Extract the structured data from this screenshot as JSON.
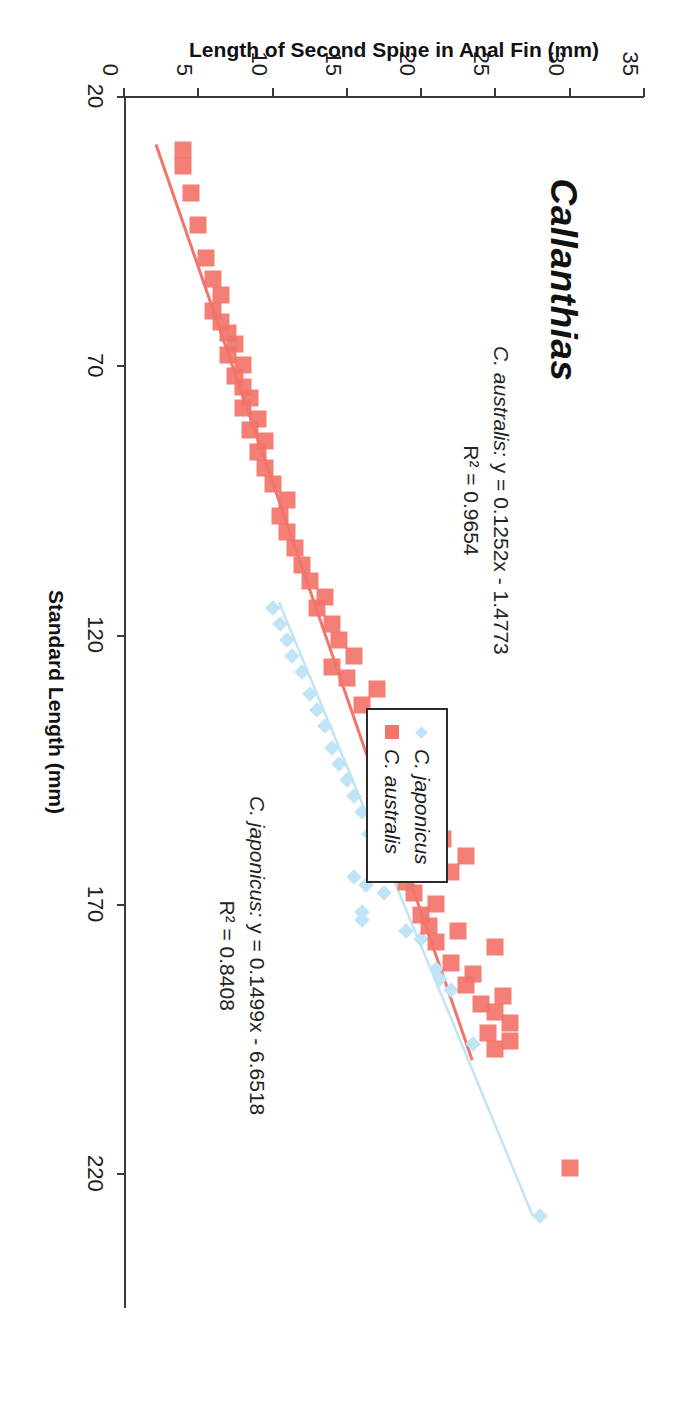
{
  "chart_data": {
    "type": "scatter",
    "title": "Callanthias",
    "xlabel": "Standard Length (mm)",
    "ylabel": "Length of Second Spine in Anal Fin (mm)",
    "xlim": [
      20,
      245
    ],
    "ylim": [
      0,
      35
    ],
    "xticks": [
      20,
      70,
      120,
      170,
      220
    ],
    "yticks": [
      0,
      5,
      10,
      15,
      20,
      25,
      30,
      35
    ],
    "grid": false,
    "legend_position": "center",
    "series": [
      {
        "name": "C. japonicus",
        "marker": "diamond",
        "color": "#bfe4f5",
        "points": [
          [
            228.0,
            28.0
          ],
          [
            196.0,
            23.5
          ],
          [
            186.0,
            22.0
          ],
          [
            184.0,
            21.3
          ],
          [
            182.0,
            21.0
          ],
          [
            176.5,
            20.0
          ],
          [
            175.0,
            19.0
          ],
          [
            173.0,
            16.0
          ],
          [
            171.5,
            16.0
          ],
          [
            168.0,
            17.5
          ],
          [
            166.5,
            16.3
          ],
          [
            165.0,
            15.5
          ],
          [
            163.0,
            18.0
          ],
          [
            160.0,
            17.5
          ],
          [
            157.0,
            16.5
          ],
          [
            153.0,
            16.0
          ],
          [
            150.0,
            15.5
          ],
          [
            147.0,
            15.0
          ],
          [
            144.0,
            14.5
          ],
          [
            141.0,
            14.0
          ],
          [
            137.0,
            13.5
          ],
          [
            134.0,
            13.0
          ],
          [
            131.0,
            12.5
          ],
          [
            127.0,
            12.0
          ],
          [
            124.0,
            11.3
          ],
          [
            121.0,
            11.0
          ],
          [
            118.0,
            10.5
          ],
          [
            115.0,
            10.0
          ]
        ],
        "trendline": {
          "equation": "y = 0.1499x - 6.6518",
          "slope": 0.1499,
          "intercept": -6.6518,
          "r2": 0.8408,
          "x_start": 114.0,
          "x_end": 228.0
        }
      },
      {
        "name": "C. australis",
        "marker": "square",
        "color": "#f2746a",
        "points": [
          [
            219.0,
            30.0
          ],
          [
            197.0,
            25.0
          ],
          [
            195.5,
            26.0
          ],
          [
            194.0,
            24.5
          ],
          [
            192.0,
            26.0
          ],
          [
            190.0,
            25.0
          ],
          [
            188.5,
            24.0
          ],
          [
            187.0,
            25.5
          ],
          [
            185.0,
            23.0
          ],
          [
            183.0,
            23.5
          ],
          [
            181.0,
            22.0
          ],
          [
            178.0,
            25.0
          ],
          [
            177.0,
            21.0
          ],
          [
            175.0,
            22.5
          ],
          [
            174.0,
            20.5
          ],
          [
            172.0,
            20.0
          ],
          [
            170.0,
            21.0
          ],
          [
            168.0,
            19.5
          ],
          [
            166.0,
            19.0
          ],
          [
            164.0,
            22.0
          ],
          [
            163.0,
            18.5
          ],
          [
            161.0,
            23.0
          ],
          [
            160.0,
            18.0
          ],
          [
            158.0,
            21.5
          ],
          [
            156.0,
            20.5
          ],
          [
            152.0,
            17.5
          ],
          [
            150.0,
            19.0
          ],
          [
            148.0,
            18.5
          ],
          [
            144.0,
            18.0
          ],
          [
            140.0,
            17.0
          ],
          [
            137.0,
            17.5
          ],
          [
            133.0,
            16.0
          ],
          [
            130.0,
            17.0
          ],
          [
            128.0,
            15.0
          ],
          [
            126.0,
            14.0
          ],
          [
            124.0,
            15.5
          ],
          [
            121.0,
            14.5
          ],
          [
            118.0,
            14.0
          ],
          [
            115.0,
            13.0
          ],
          [
            113.0,
            13.5
          ],
          [
            110.0,
            12.5
          ],
          [
            107.0,
            12.0
          ],
          [
            104.0,
            11.5
          ],
          [
            101.0,
            11.0
          ],
          [
            98.0,
            10.5
          ],
          [
            95.0,
            11.0
          ],
          [
            92.0,
            10.0
          ],
          [
            89.0,
            9.5
          ],
          [
            86.0,
            9.0
          ],
          [
            84.0,
            9.5
          ],
          [
            82.0,
            8.5
          ],
          [
            80.0,
            9.0
          ],
          [
            78.0,
            8.0
          ],
          [
            76.0,
            8.5
          ],
          [
            74.0,
            8.0
          ],
          [
            72.0,
            7.5
          ],
          [
            70.0,
            8.0
          ],
          [
            68.0,
            7.0
          ],
          [
            66.0,
            7.5
          ],
          [
            64.0,
            7.0
          ],
          [
            62.0,
            6.5
          ],
          [
            60.0,
            6.0
          ],
          [
            57.0,
            6.5
          ],
          [
            54.0,
            6.0
          ],
          [
            50.0,
            5.5
          ],
          [
            44.0,
            5.0
          ],
          [
            38.0,
            4.5
          ],
          [
            33.0,
            4.0
          ],
          [
            30.0,
            4.0
          ]
        ],
        "trendline": {
          "equation": "y = 0.1252x - 1.4773",
          "slope": 0.1252,
          "intercept": -1.4773,
          "r2": 0.9654,
          "x_start": 29.0,
          "x_end": 199.0
        }
      }
    ],
    "annotations": [
      {
        "id": "eqn-australis",
        "species": "C. australis:",
        "line1": " y = 0.1252x - 1.4773",
        "line2": "R² = 0.9654"
      },
      {
        "id": "eqn-japonicus",
        "species": "C. japonicus:",
        "line1": " y = 0.1499x - 6.6518",
        "line2": "R² = 0.8408"
      }
    ],
    "legend": [
      {
        "label": "C. japonicus",
        "marker": "diamond-icon",
        "color": "#bfe4f5"
      },
      {
        "label": "C. australis",
        "marker": "square-icon",
        "color": "#f2746a"
      }
    ]
  }
}
